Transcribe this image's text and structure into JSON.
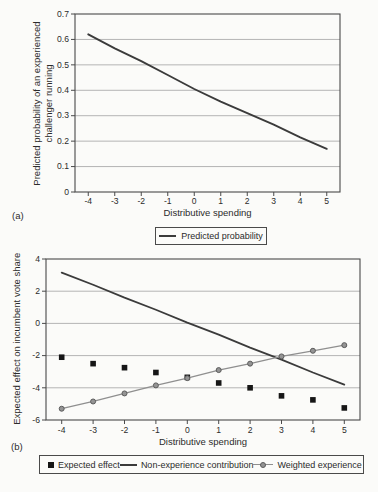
{
  "colors": {
    "frame": "#4a4a4a",
    "grid": "#b4b4b4",
    "text": "#2b2b2b",
    "legend_border": "#4a4a4a"
  },
  "chart_data": [
    {
      "type": "line",
      "panel_label": "(a)",
      "xlabel": "Distributive spending",
      "ylabel_lines": [
        "Predicted probability of an experienced",
        "challenger running"
      ],
      "xlim": [
        -4.5,
        5.5
      ],
      "ylim": [
        0,
        0.7
      ],
      "x": [
        -4,
        -3,
        -2,
        -1,
        0,
        1,
        2,
        3,
        4,
        5
      ],
      "xtick_labels": [
        "-4",
        "-3",
        "-2",
        "-1",
        "0",
        "1",
        "2",
        "3",
        "4",
        "5"
      ],
      "yticks": [
        0,
        0.1,
        0.2,
        0.3,
        0.4,
        0.5,
        0.6,
        0.7
      ],
      "ytick_labels": [
        "0",
        "0.1",
        "0.2",
        "0.3",
        "0.4",
        "0.5",
        "0.6",
        "0.7"
      ],
      "grid": "horizontal",
      "legend_position": "below-center",
      "series": [
        {
          "name": "Predicted probability",
          "type": "line",
          "color": "#3b3b3b",
          "width": 1.9,
          "values": [
            0.62,
            0.565,
            0.515,
            0.46,
            0.405,
            0.355,
            0.31,
            0.265,
            0.215,
            0.17
          ]
        }
      ]
    },
    {
      "type": "mixed",
      "panel_label": "(b)",
      "xlabel": "Distributive spending",
      "ylabel": "Expected effect on incumbent vote share",
      "xlim": [
        -4.5,
        5.5
      ],
      "ylim": [
        -6,
        4
      ],
      "x": [
        -4,
        -3,
        -2,
        -1,
        0,
        1,
        2,
        3,
        4,
        5
      ],
      "xtick_labels": [
        "-4",
        "-3",
        "-2",
        "-1",
        "0",
        "1",
        "2",
        "3",
        "4",
        "5"
      ],
      "yticks": [
        -6,
        -4,
        -2,
        0,
        2,
        4
      ],
      "ytick_labels": [
        "-6",
        "-4",
        "-2",
        "0",
        "2",
        "4"
      ],
      "grid": "horizontal",
      "legend_position": "below-center",
      "series": [
        {
          "name": "Expected effect",
          "type": "scatter",
          "marker": "square",
          "color": "#161616",
          "values": [
            -2.1,
            -2.5,
            -2.75,
            -3.05,
            -3.35,
            -3.7,
            -4.0,
            -4.5,
            -4.75,
            -5.25
          ]
        },
        {
          "name": "Non-experience contribution",
          "type": "line",
          "color": "#3b3b3b",
          "width": 1.8,
          "values": [
            3.15,
            2.4,
            1.6,
            0.85,
            0.05,
            -0.7,
            -1.5,
            -2.25,
            -3.05,
            -3.8
          ]
        },
        {
          "name": "Weighted experience",
          "type": "line",
          "marker": "circle",
          "color": "#8f8f8f",
          "width": 1.3,
          "marker_fill": "#949494",
          "marker_edge": "#5c5c5c",
          "values": [
            -5.3,
            -4.85,
            -4.35,
            -3.85,
            -3.4,
            -2.9,
            -2.5,
            -2.05,
            -1.7,
            -1.35
          ]
        }
      ]
    }
  ]
}
